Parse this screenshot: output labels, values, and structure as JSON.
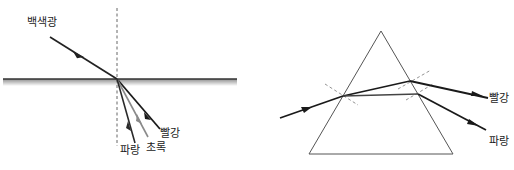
{
  "left_diagram": {
    "incident_label": "백색광",
    "rays": [
      {
        "name": "red",
        "label": "빨강",
        "color": "#1a1a1a"
      },
      {
        "name": "green",
        "label": "초록",
        "color": "#8a8a8a"
      },
      {
        "name": "blue",
        "label": "파랑",
        "color": "#2a2a2a"
      }
    ],
    "caption": ""
  },
  "right_diagram": {
    "rays": [
      {
        "name": "red",
        "label": "빨강"
      },
      {
        "name": "blue",
        "label": "파랑"
      }
    ],
    "caption": ""
  },
  "colors": {
    "line": "#222222",
    "dashed": "#555555",
    "surface_shade_start": "#9a9a9a",
    "surface_shade_end": "#ffffff",
    "prism_outline": "#555555"
  }
}
